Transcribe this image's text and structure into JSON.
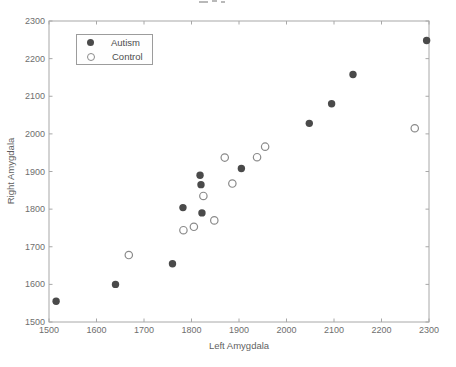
{
  "figure": {
    "background_color": "#ffffff",
    "axis_line_color": "#a8a8a8",
    "tick_label_color": "#6e6e6e",
    "note_cropped_title": "partial title text cut off at top edge of screenshot"
  },
  "chart_data": {
    "type": "scatter",
    "title": "",
    "xlabel": "Left Amygdala",
    "ylabel": "Right Amygdala",
    "xlim": [
      1500,
      2300
    ],
    "ylim": [
      1500,
      2300
    ],
    "xticks": [
      1500,
      1600,
      1700,
      1800,
      1900,
      2000,
      2100,
      2200,
      2300
    ],
    "yticks": [
      1500,
      1600,
      1700,
      1800,
      1900,
      2000,
      2100,
      2200,
      2300
    ],
    "grid": false,
    "legend_position": "upper-left",
    "series": [
      {
        "name": "Autism",
        "marker": "filled-circle",
        "color": "#4a4a4a",
        "points": [
          [
            1515,
            1555
          ],
          [
            1640,
            1600
          ],
          [
            1760,
            1655
          ],
          [
            1782,
            1804
          ],
          [
            1818,
            1890
          ],
          [
            1820,
            1865
          ],
          [
            1822,
            1790
          ],
          [
            1905,
            1908
          ],
          [
            2048,
            2028
          ],
          [
            2095,
            2080
          ],
          [
            2140,
            2158
          ],
          [
            2295,
            2248
          ]
        ]
      },
      {
        "name": "Control",
        "marker": "open-circle",
        "color": "#8a8a8a",
        "points": [
          [
            1668,
            1678
          ],
          [
            1783,
            1744
          ],
          [
            1805,
            1753
          ],
          [
            1825,
            1835
          ],
          [
            1848,
            1770
          ],
          [
            1870,
            1937
          ],
          [
            1886,
            1868
          ],
          [
            1938,
            1938
          ],
          [
            1955,
            1966
          ],
          [
            2270,
            2015
          ]
        ]
      }
    ]
  }
}
